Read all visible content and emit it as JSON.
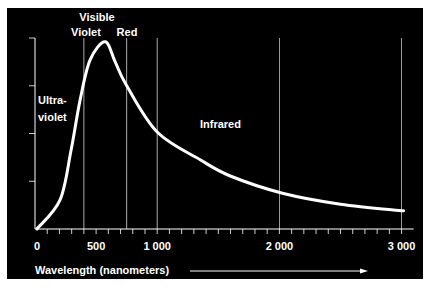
{
  "chart_data": {
    "type": "line",
    "title": "",
    "xlabel": "Wavelength (nanometers)",
    "ylabel": "",
    "xlim": [
      0,
      3050
    ],
    "ylim": [
      0,
      4
    ],
    "x_ticks": [
      0,
      500,
      1000,
      2000,
      3000
    ],
    "x_tick_labels": [
      "0",
      "500",
      "1 000",
      "2 000",
      "3 000"
    ],
    "x_minor_tick_step": 100,
    "y_ticks": [
      1,
      2,
      3,
      4
    ],
    "y_tick_labels": [
      "",
      "",
      "",
      ""
    ],
    "grid": "vertical lines at region boundaries and major x ticks",
    "reference_lines": [
      {
        "x": 400,
        "label": "Violet"
      },
      {
        "x": 750,
        "label": "Red"
      },
      {
        "x": 1000,
        "label": ""
      },
      {
        "x": 2000,
        "label": ""
      },
      {
        "x": 3000,
        "label": ""
      }
    ],
    "annotations": [
      {
        "text": "Visible",
        "x": 510,
        "y": 4.5
      },
      {
        "text": "Violet",
        "x": 330,
        "y": 4.15
      },
      {
        "text": "Red",
        "x": 750,
        "y": 4.15
      },
      {
        "text": "Ultra-",
        "x": 0,
        "y": 2.7
      },
      {
        "text": "violet",
        "x": 0,
        "y": 2.25
      },
      {
        "text": "Infrared",
        "x": 1350,
        "y": 2.1
      }
    ],
    "series": [
      {
        "name": "Solar spectrum intensity",
        "x": [
          16,
          205,
          295,
          369,
          451,
          574,
          656,
          746,
          1000,
          1352,
          1598,
          2025,
          2500,
          3016
        ],
        "y": [
          0,
          0.61,
          1.65,
          2.7,
          3.54,
          3.92,
          3.5,
          3.02,
          2.03,
          1.45,
          1.11,
          0.75,
          0.52,
          0.38
        ]
      }
    ],
    "legend": "none",
    "axis_arrow": "right"
  },
  "colors": {
    "background": "#000000",
    "foreground": "#ffffff",
    "page": "#ffffff"
  }
}
